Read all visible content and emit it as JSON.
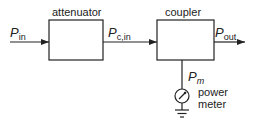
{
  "diagram": {
    "blocks": [
      {
        "id": "attenuator",
        "label": "attenuator"
      },
      {
        "id": "coupler",
        "label": "coupler"
      }
    ],
    "signals": {
      "input": {
        "symbol": "P",
        "subscript": "in"
      },
      "coupler_in": {
        "symbol": "P",
        "subscript": "c,in"
      },
      "output": {
        "symbol": "P",
        "subscript": "out"
      },
      "monitor": {
        "symbol": "P",
        "subscript": "m"
      }
    },
    "meter": {
      "line1": "power",
      "line2": "meter"
    },
    "colors": {
      "stroke": "#222222",
      "background": "#ffffff"
    }
  }
}
